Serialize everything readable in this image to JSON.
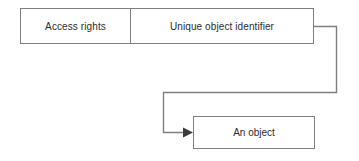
{
  "diagram": {
    "background_color": "#ffffff",
    "line_color": "#7f7f7f",
    "text_color": "#2b2b2b",
    "capability_record": {
      "fields": [
        {
          "label": "Access rights"
        },
        {
          "label": "Unique object identifier"
        }
      ]
    },
    "target": {
      "label": "An object"
    },
    "connector": {
      "from": "Unique object identifier",
      "to": "An object",
      "style": "orthogonal-elbow",
      "arrowhead": "solid-triangle",
      "direction": "right"
    }
  }
}
